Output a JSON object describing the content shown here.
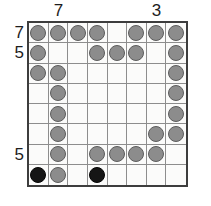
{
  "puzzle": {
    "title": "nonogram-stone-grid",
    "grid": {
      "rows": 8,
      "cols": 8,
      "empty_token": ".",
      "gray_token": "G",
      "black_token": "B",
      "cells": [
        [
          "G",
          "G",
          "G",
          "G",
          ".",
          "G",
          "G",
          "G"
        ],
        [
          "G",
          ".",
          ".",
          "G",
          "G",
          "G",
          ".",
          "G"
        ],
        [
          "G",
          "G",
          ".",
          ".",
          ".",
          ".",
          ".",
          "G"
        ],
        [
          ".",
          "G",
          ".",
          ".",
          ".",
          ".",
          ".",
          "G"
        ],
        [
          ".",
          "G",
          ".",
          ".",
          ".",
          ".",
          ".",
          "G"
        ],
        [
          ".",
          "G",
          ".",
          ".",
          ".",
          ".",
          "G",
          "G"
        ],
        [
          ".",
          "G",
          ".",
          "G",
          "G",
          "G",
          "G",
          "."
        ],
        [
          "B",
          "G",
          ".",
          "B",
          ".",
          ".",
          ".",
          "."
        ]
      ]
    },
    "clues": {
      "top": [
        {
          "label": "7",
          "col": 2
        },
        {
          "label": "3",
          "col": 7
        }
      ],
      "left": [
        {
          "label": "7",
          "row": 1
        },
        {
          "label": "5",
          "row": 2
        },
        {
          "label": "5",
          "row": 7
        }
      ]
    },
    "colors": {
      "gray_stone": "#8c8c8c",
      "gray_stone_border": "#5c5c5c",
      "black_stone": "#151515",
      "grid_line": "#8d8d8d",
      "grid_border": "#3d3d3d",
      "background": "#fbfbfa",
      "clue_text": "#1d1d1d"
    }
  }
}
